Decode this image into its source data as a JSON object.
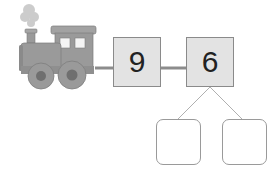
{
  "diagram": {
    "type": "number-train-bond",
    "engine": {
      "icon": "train-engine-icon"
    },
    "cars": [
      {
        "value": "9"
      },
      {
        "value": "6"
      }
    ],
    "answer_boxes": [
      {
        "value": ""
      },
      {
        "value": ""
      }
    ],
    "colors": {
      "engine": "#9a9a9a",
      "box_fill": "#e3e3e3",
      "box_border": "#8a8a8a",
      "connector": "#8c8c8c",
      "branch_line": "#b0b0b0"
    }
  }
}
